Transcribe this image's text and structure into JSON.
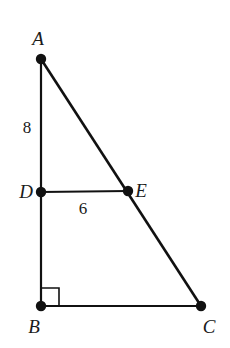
{
  "figure": {
    "kind": "geometry-diagram",
    "background_color": "#ffffff",
    "stroke_color": "#111111",
    "label_color": "#1a1a1a",
    "canvas": {
      "width": 230,
      "height": 348
    },
    "vertices": [
      {
        "id": "A",
        "label": "A",
        "x": 41,
        "y": 59,
        "label_x": 38,
        "label_y": 45,
        "label_anchor": "middle"
      },
      {
        "id": "B",
        "label": "B",
        "x": 41,
        "y": 306,
        "label_x": 34,
        "label_y": 333,
        "label_anchor": "middle"
      },
      {
        "id": "C",
        "label": "C",
        "x": 201,
        "y": 306,
        "label_x": 209,
        "label_y": 333,
        "label_anchor": "middle"
      },
      {
        "id": "D",
        "label": "D",
        "x": 41,
        "y": 192,
        "label_x": 26,
        "label_y": 198,
        "label_anchor": "middle"
      },
      {
        "id": "E",
        "label": "E",
        "x": 128,
        "y": 191,
        "label_x": 141,
        "label_y": 197,
        "label_anchor": "middle"
      }
    ],
    "edges": [
      {
        "id": "AB",
        "from": "A",
        "to": "B",
        "x1": 41,
        "y1": 59,
        "x2": 41,
        "y2": 306,
        "width": 2.2
      },
      {
        "id": "BC",
        "from": "B",
        "to": "C",
        "x1": 41,
        "y1": 306,
        "x2": 201,
        "y2": 306,
        "width": 2.2
      },
      {
        "id": "AC",
        "from": "A",
        "to": "C",
        "x1": 41,
        "y1": 59,
        "x2": 201,
        "y2": 306,
        "width": 2.6
      },
      {
        "id": "DE",
        "from": "D",
        "to": "E",
        "x1": 41,
        "y1": 192,
        "x2": 128,
        "y2": 191,
        "width": 2.0
      }
    ],
    "measurements": [
      {
        "id": "AD",
        "value": "8",
        "x": 27,
        "y": 133,
        "describes": "length of segment A to D"
      },
      {
        "id": "DE",
        "value": "6",
        "x": 83,
        "y": 214,
        "describes": "length of segment D to E"
      }
    ],
    "right_angle": {
      "at_vertex": "B",
      "size": 18,
      "x": 41,
      "y": 306,
      "path": "M 41 288 L 59 288 L 59 306"
    },
    "dot_radius": 5.2
  }
}
